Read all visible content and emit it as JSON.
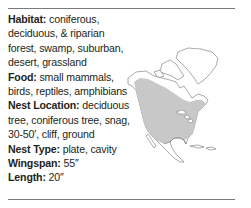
{
  "facts": [
    {
      "label": "Habitat:",
      "value": " coniferous, deciduous, & riparian forest, swamp, suburban, desert, grassland"
    },
    {
      "label": "Food:",
      "value": " small mammals, birds, reptiles, amphibians"
    },
    {
      "label": "Nest Location:",
      "value": " deciduous tree, coniferous tree, snag, 30-50′, cliff, ground"
    },
    {
      "label": "Nest Type:",
      "value": " plate, cavity"
    },
    {
      "label": "Wingspan:",
      "value": " 55″"
    },
    {
      "label": "Length:",
      "value": " 20″"
    }
  ],
  "map": {
    "region": "North America",
    "range_color": "#c8c8c8",
    "land_color": "#ffffff",
    "outline_color": "#555555"
  }
}
